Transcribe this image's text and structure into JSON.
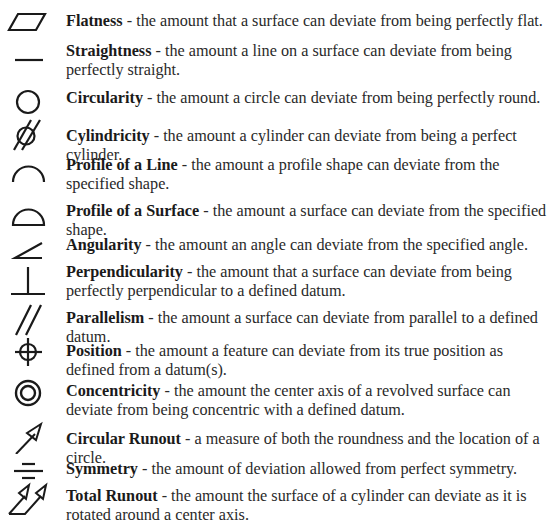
{
  "items": [
    {
      "term": "Flatness",
      "sep": " - ",
      "desc": "the amount that a surface can deviate from being perfectly flat.",
      "icon": "flatness-icon",
      "top": 12
    },
    {
      "term": "Straightness",
      "sep": " - ",
      "desc": "the amount a line on a surface can deviate from being perfectly straight.",
      "icon": "straightness-icon",
      "top": 42
    },
    {
      "term": "Circularity",
      "sep": " - ",
      "desc": "the amount a circle can deviate from being perfectly round.",
      "icon": "circularity-icon",
      "top": 89
    },
    {
      "term": "Cylindricity",
      "sep": " - ",
      "desc": "the amount a cylinder can deviate from being a perfect cylinder.",
      "icon": "cylindricity-icon",
      "top": 127
    },
    {
      "term": "Profile of a Line",
      "sep": " - ",
      "desc": "the amount a profile shape can deviate from the specified shape.",
      "icon": "profile-of-a-line-icon",
      "top": 156
    },
    {
      "term": "Profile of a Surface",
      "sep": " - ",
      "desc": "the amount a surface can deviate from the specified shape.",
      "icon": "profile-of-a-surface-icon",
      "top": 202
    },
    {
      "term": "Angularity",
      "sep": " - ",
      "desc": "the amount an angle can deviate from the specified angle.",
      "icon": "angularity-icon",
      "top": 236
    },
    {
      "term": "Perpendicularity",
      "sep": " - ",
      "desc": "the amount that a surface can deviate from being perfectly perpendicular to a defined datum.",
      "icon": "perpendicularity-icon",
      "top": 263
    },
    {
      "term": "Parallelism",
      "sep": " - ",
      "desc": "the amount a surface can deviate from parallel to a defined datum.",
      "icon": "parallelism-icon",
      "top": 309
    },
    {
      "term": "Position",
      "sep": " - ",
      "desc": "the amount a feature can deviate from its true position as defined from a datum(s).",
      "icon": "position-icon",
      "top": 342
    },
    {
      "term": "Concentricity",
      "sep": " - ",
      "desc": "the amount the center axis of a revolved surface can deviate from being concentric with a defined datum.",
      "icon": "concentricity-icon",
      "top": 382
    },
    {
      "term": "Circular Runout",
      "sep": " - ",
      "desc": "a measure of both the roundness and the location of a circle.",
      "icon": "circular-runout-icon",
      "top": 430
    },
    {
      "term": "Symmetry",
      "sep": " - ",
      "desc": "the amount of deviation allowed from perfect symmetry.",
      "icon": "symmetry-icon",
      "top": 460
    },
    {
      "term": "Total Runout",
      "sep": " - ",
      "desc": "the amount the surface of a cylinder can deviate as it is rotated around a center axis.",
      "icon": "total-runout-icon",
      "top": 487
    }
  ]
}
